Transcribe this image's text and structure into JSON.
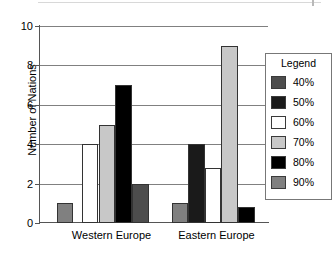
{
  "chart_data": {
    "type": "bar",
    "title": "",
    "xlabel": "",
    "ylabel": "Number of Nations",
    "categories": [
      "Western Europe",
      "Eastern Europe"
    ],
    "ylim": [
      0,
      10
    ],
    "yticks": [
      0,
      2,
      4,
      6,
      8,
      10
    ],
    "ytick_labels": [
      "0",
      "2",
      "4",
      "6",
      "8",
      "10"
    ],
    "grid": true,
    "legend_title": "Legend",
    "legend_position": "right",
    "series": [
      {
        "name": "40%",
        "color": "#4d4d4d",
        "values": [
          0,
          0
        ]
      },
      {
        "name": "50%",
        "color": "#1a1a1a",
        "values": [
          0,
          0
        ]
      },
      {
        "name": "60%",
        "color": "#ffffff",
        "values": [
          0,
          0
        ]
      },
      {
        "name": "70%",
        "color": "#c8c8c8",
        "values": [
          0,
          0
        ]
      },
      {
        "name": "80%",
        "color": "#000000",
        "values": [
          0,
          0
        ]
      },
      {
        "name": "90%",
        "color": "#808080",
        "values": [
          0,
          0
        ]
      }
    ],
    "bars": [
      {
        "group": "Western Europe",
        "series": "90%",
        "value": 1,
        "color": "#808080",
        "x": 18,
        "w": 16
      },
      {
        "group": "Western Europe",
        "series": "60%",
        "value": 4,
        "color": "#ffffff",
        "x": 43,
        "w": 16
      },
      {
        "group": "Western Europe",
        "series": "70%",
        "value": 5,
        "color": "#c8c8c8",
        "x": 60,
        "w": 16
      },
      {
        "group": "Western Europe",
        "series": "80%",
        "value": 7,
        "color": "#000000",
        "x": 76,
        "w": 17
      },
      {
        "group": "Western Europe",
        "series": "40%",
        "value": 2,
        "color": "#4d4d4d",
        "x": 93,
        "w": 17
      },
      {
        "group": "Eastern Europe",
        "series": "90%",
        "value": 1,
        "color": "#808080",
        "x": 133,
        "w": 16
      },
      {
        "group": "Eastern Europe",
        "series": "50%",
        "value": 4,
        "color": "#1a1a1a",
        "x": 149,
        "w": 17
      },
      {
        "group": "Eastern Europe",
        "series": "60%",
        "value": 2.8,
        "color": "#ffffff",
        "x": 166,
        "w": 16
      },
      {
        "group": "Eastern Europe",
        "series": "70%",
        "value": 9,
        "color": "#c8c8c8",
        "x": 182,
        "w": 17
      },
      {
        "group": "Eastern Europe",
        "series": "80%",
        "value": 0.8,
        "color": "#000000",
        "x": 199,
        "w": 17
      }
    ],
    "group_label_positions": [
      {
        "label": "Western Europe",
        "left": 20,
        "width": 105
      },
      {
        "label": "Eastern Europe",
        "left": 125,
        "width": 105
      }
    ]
  }
}
